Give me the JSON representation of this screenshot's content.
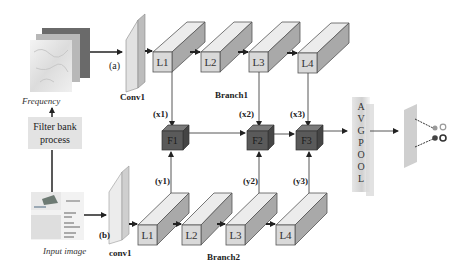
{
  "diagram": {
    "inputs": {
      "frequency_label": "Frequency",
      "filter_bank_label_line1": "Filter bank",
      "filter_bank_label_line2": "process",
      "input_image_label": "Input image"
    },
    "convs": {
      "top_label": "Conv1",
      "top_tag": "(a)",
      "bottom_label": "conv1",
      "bottom_tag": "(b)"
    },
    "branch1": {
      "title": "Branch1",
      "layers": [
        "L1",
        "L2",
        "L3",
        "L4"
      ],
      "links": [
        "(x1)",
        "(x2)",
        "(x3)"
      ]
    },
    "branch2": {
      "title": "Branch2",
      "layers": [
        "L1",
        "L2",
        "L3",
        "L4"
      ],
      "links": [
        "(y1)",
        "(y2)",
        "(y3)"
      ]
    },
    "fusion": {
      "nodes": [
        "F1",
        "F2",
        "F3"
      ]
    },
    "pooling": {
      "letters": [
        "A",
        "V",
        "G",
        "P",
        "O",
        "O",
        "L"
      ]
    },
    "output": {
      "icons": [
        "fc-layer-icon",
        "class-output-icon"
      ]
    },
    "colors": {
      "box_front": "#d9d9d9",
      "box_top": "#ececec",
      "box_side": "#a9a9a9",
      "fusion_front": "#5a5a5a",
      "fusion_top": "#7a7a7a",
      "fusion_side": "#454545",
      "arrow": "#222222",
      "filter_bank_bg": "#e3e3e3"
    }
  }
}
